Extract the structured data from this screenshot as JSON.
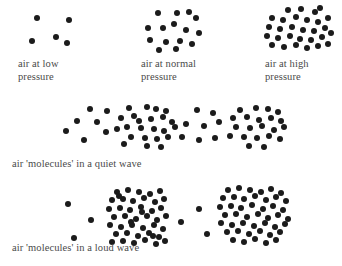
{
  "figure": {
    "background_color": "#ffffff",
    "molecule_color": "#1b1b1b",
    "caption_color": "#4a4a4a"
  },
  "pressure_row": {
    "panels": [
      {
        "id": "low-pressure",
        "caption": "air at low\npressure",
        "caption_x": 18,
        "caption_y": 58,
        "density_label": "low",
        "molecule_count": 5
      },
      {
        "id": "normal-pressure",
        "caption": "air at normal\npressure",
        "caption_x": 141,
        "caption_y": 58,
        "density_label": "normal",
        "molecule_count": 15
      },
      {
        "id": "high-pressure",
        "caption": "air at high\npressure",
        "caption_x": 265,
        "caption_y": 58,
        "density_label": "high",
        "molecule_count": 29
      }
    ]
  },
  "quiet_wave": {
    "caption": "air 'molecules' in a quiet wave",
    "caption_x": 12,
    "caption_y": 158,
    "regions": [
      {
        "id": "rarefaction-1",
        "type": "rarefaction",
        "molecule_count": 8
      },
      {
        "id": "compression-1",
        "type": "compression",
        "molecule_count": 22
      },
      {
        "id": "rarefaction-2",
        "type": "rarefaction",
        "molecule_count": 8
      },
      {
        "id": "compression-2",
        "type": "compression",
        "molecule_count": 21
      }
    ]
  },
  "loud_wave": {
    "caption": "air 'molecules' in a loud wave",
    "caption_x": 12,
    "caption_y": 242,
    "regions": [
      {
        "id": "rarefaction-1",
        "type": "rarefaction",
        "molecule_count": 3
      },
      {
        "id": "compression-1",
        "type": "compression",
        "molecule_count": 44
      },
      {
        "id": "rarefaction-2",
        "type": "rarefaction",
        "molecule_count": 3
      },
      {
        "id": "compression-2",
        "type": "compression",
        "molecule_count": 45
      }
    ]
  },
  "chart_data": {
    "type": "scatter",
    "xlabel": "",
    "ylabel": "",
    "series": [
      {
        "name": "air at low pressure",
        "dot_radius": 3.0,
        "points": [
          [
            37,
            18
          ],
          [
            69,
            20
          ],
          [
            32,
            41
          ],
          [
            56,
            37
          ],
          [
            67,
            43
          ]
        ]
      },
      {
        "name": "air at normal pressure",
        "dot_radius": 3.1,
        "points": [
          [
            158,
            13
          ],
          [
            177,
            13
          ],
          [
            189,
            12
          ],
          [
            196,
            18
          ],
          [
            148,
            28
          ],
          [
            163,
            28
          ],
          [
            174,
            24
          ],
          [
            186,
            30
          ],
          [
            199,
            33
          ],
          [
            150,
            40
          ],
          [
            166,
            42
          ],
          [
            180,
            41
          ],
          [
            192,
            44
          ],
          [
            159,
            50
          ],
          [
            176,
            49
          ]
        ]
      },
      {
        "name": "air at high pressure",
        "dot_radius": 3.2,
        "points": [
          [
            288,
            10
          ],
          [
            301,
            9
          ],
          [
            315,
            12
          ],
          [
            320,
            8
          ],
          [
            272,
            18
          ],
          [
            283,
            20
          ],
          [
            296,
            17
          ],
          [
            307,
            20
          ],
          [
            318,
            22
          ],
          [
            328,
            18
          ],
          [
            269,
            27
          ],
          [
            280,
            29
          ],
          [
            292,
            27
          ],
          [
            303,
            30
          ],
          [
            314,
            31
          ],
          [
            325,
            28
          ],
          [
            267,
            36
          ],
          [
            278,
            38
          ],
          [
            290,
            36
          ],
          [
            300,
            39
          ],
          [
            311,
            40
          ],
          [
            322,
            37
          ],
          [
            331,
            33
          ],
          [
            272,
            45
          ],
          [
            284,
            47
          ],
          [
            296,
            45
          ],
          [
            307,
            48
          ],
          [
            318,
            46
          ],
          [
            328,
            44
          ]
        ]
      },
      {
        "name": "quiet wave rarefaction 1",
        "dot_radius": 3.1,
        "points": [
          [
            90,
            109
          ],
          [
            107,
            111
          ],
          [
            77,
            121
          ],
          [
            97,
            122
          ],
          [
            66,
            131
          ],
          [
            106,
            132
          ],
          [
            84,
            140
          ],
          [
            117,
            129
          ]
        ]
      },
      {
        "name": "quiet wave compression 1",
        "dot_radius": 3.1,
        "points": [
          [
            129,
            108
          ],
          [
            147,
            107
          ],
          [
            156,
            109
          ],
          [
            166,
            111
          ],
          [
            121,
            118
          ],
          [
            134,
            116
          ],
          [
            139,
            121
          ],
          [
            151,
            119
          ],
          [
            163,
            117
          ],
          [
            172,
            122
          ],
          [
            127,
            127
          ],
          [
            141,
            128
          ],
          [
            154,
            129
          ],
          [
            164,
            131
          ],
          [
            175,
            127
          ],
          [
            131,
            137
          ],
          [
            145,
            138
          ],
          [
            157,
            139
          ],
          [
            168,
            137
          ],
          [
            124,
            144
          ],
          [
            147,
            146
          ],
          [
            161,
            147
          ]
        ]
      },
      {
        "name": "quiet wave rarefaction 2",
        "dot_radius": 3.1,
        "points": [
          [
            197,
            110
          ],
          [
            213,
            113
          ],
          [
            186,
            124
          ],
          [
            204,
            126
          ],
          [
            219,
            122
          ],
          [
            182,
            137
          ],
          [
            199,
            140
          ],
          [
            215,
            138
          ]
        ]
      },
      {
        "name": "quiet wave compression 2",
        "dot_radius": 3.1,
        "points": [
          [
            240,
            110
          ],
          [
            256,
            108
          ],
          [
            268,
            109
          ],
          [
            278,
            112
          ],
          [
            233,
            118
          ],
          [
            247,
            117
          ],
          [
            259,
            120
          ],
          [
            271,
            118
          ],
          [
            281,
            121
          ],
          [
            236,
            127
          ],
          [
            250,
            128
          ],
          [
            262,
            126
          ],
          [
            274,
            130
          ],
          [
            284,
            127
          ],
          [
            230,
            136
          ],
          [
            244,
            137
          ],
          [
            257,
            138
          ],
          [
            269,
            136
          ],
          [
            280,
            139
          ],
          [
            249,
            146
          ],
          [
            264,
            147
          ]
        ]
      },
      {
        "name": "loud wave rarefaction 1",
        "dot_radius": 3.1,
        "points": [
          [
            68,
            204
          ],
          [
            91,
            220
          ],
          [
            74,
            238
          ]
        ]
      },
      {
        "name": "loud wave compression 1",
        "dot_radius": 3.2,
        "points": [
          [
            117,
            192
          ],
          [
            128,
            190
          ],
          [
            139,
            192
          ],
          [
            150,
            194
          ],
          [
            160,
            191
          ],
          [
            112,
            200
          ],
          [
            123,
            199
          ],
          [
            133,
            201
          ],
          [
            144,
            198
          ],
          [
            155,
            202
          ],
          [
            164,
            199
          ],
          [
            109,
            209
          ],
          [
            120,
            208
          ],
          [
            130,
            210
          ],
          [
            141,
            207
          ],
          [
            152,
            211
          ],
          [
            161,
            208
          ],
          [
            114,
            217
          ],
          [
            125,
            216
          ],
          [
            136,
            219
          ],
          [
            147,
            216
          ],
          [
            157,
            220
          ],
          [
            166,
            216
          ],
          [
            110,
            225
          ],
          [
            121,
            227
          ],
          [
            132,
            225
          ],
          [
            143,
            228
          ],
          [
            154,
            225
          ],
          [
            163,
            229
          ],
          [
            116,
            234
          ],
          [
            127,
            233
          ],
          [
            138,
            236
          ],
          [
            149,
            233
          ],
          [
            159,
            237
          ],
          [
            112,
            242
          ],
          [
            123,
            241
          ],
          [
            134,
            243
          ],
          [
            145,
            240
          ],
          [
            156,
            244
          ],
          [
            165,
            241
          ],
          [
            119,
            196
          ],
          [
            131,
            222
          ],
          [
            142,
            212
          ],
          [
            153,
            236
          ]
        ]
      },
      {
        "name": "loud wave rarefaction 2",
        "dot_radius": 3.1,
        "points": [
          [
            181,
            222
          ],
          [
            199,
            209
          ],
          [
            207,
            234
          ]
        ]
      },
      {
        "name": "loud wave compression 2",
        "dot_radius": 3.2,
        "points": [
          [
            228,
            190
          ],
          [
            239,
            188
          ],
          [
            250,
            190
          ],
          [
            261,
            192
          ],
          [
            271,
            189
          ],
          [
            281,
            193
          ],
          [
            223,
            198
          ],
          [
            234,
            197
          ],
          [
            244,
            199
          ],
          [
            255,
            196
          ],
          [
            266,
            200
          ],
          [
            276,
            197
          ],
          [
            286,
            201
          ],
          [
            220,
            207
          ],
          [
            231,
            206
          ],
          [
            241,
            208
          ],
          [
            252,
            205
          ],
          [
            263,
            209
          ],
          [
            273,
            206
          ],
          [
            283,
            210
          ],
          [
            225,
            215
          ],
          [
            236,
            214
          ],
          [
            247,
            217
          ],
          [
            258,
            214
          ],
          [
            268,
            218
          ],
          [
            278,
            215
          ],
          [
            288,
            219
          ],
          [
            221,
            223
          ],
          [
            232,
            225
          ],
          [
            243,
            223
          ],
          [
            254,
            226
          ],
          [
            265,
            223
          ],
          [
            275,
            227
          ],
          [
            285,
            224
          ],
          [
            227,
            232
          ],
          [
            238,
            231
          ],
          [
            249,
            234
          ],
          [
            260,
            231
          ],
          [
            270,
            235
          ],
          [
            280,
            232
          ],
          [
            233,
            240
          ],
          [
            244,
            242
          ],
          [
            255,
            239
          ],
          [
            266,
            243
          ],
          [
            276,
            240
          ]
        ]
      }
    ]
  }
}
